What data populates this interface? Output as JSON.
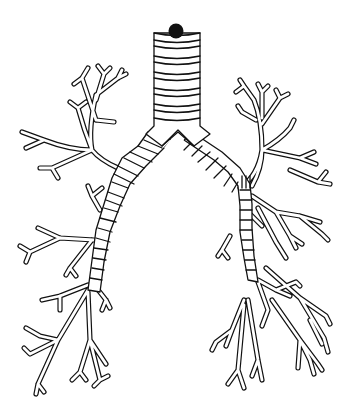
{
  "illustration": {
    "subject": "bronchial-tree",
    "style": "black line drawing on white background",
    "colors": {
      "background": "#ffffff",
      "line": "#111111",
      "cap": "#111111"
    },
    "parts": [
      "trachea",
      "tracheal-rings",
      "carina",
      "right-main-bronchus",
      "left-main-bronchus",
      "right-bronchial-branches",
      "left-bronchial-branches",
      "tracheal-top-cap"
    ]
  }
}
